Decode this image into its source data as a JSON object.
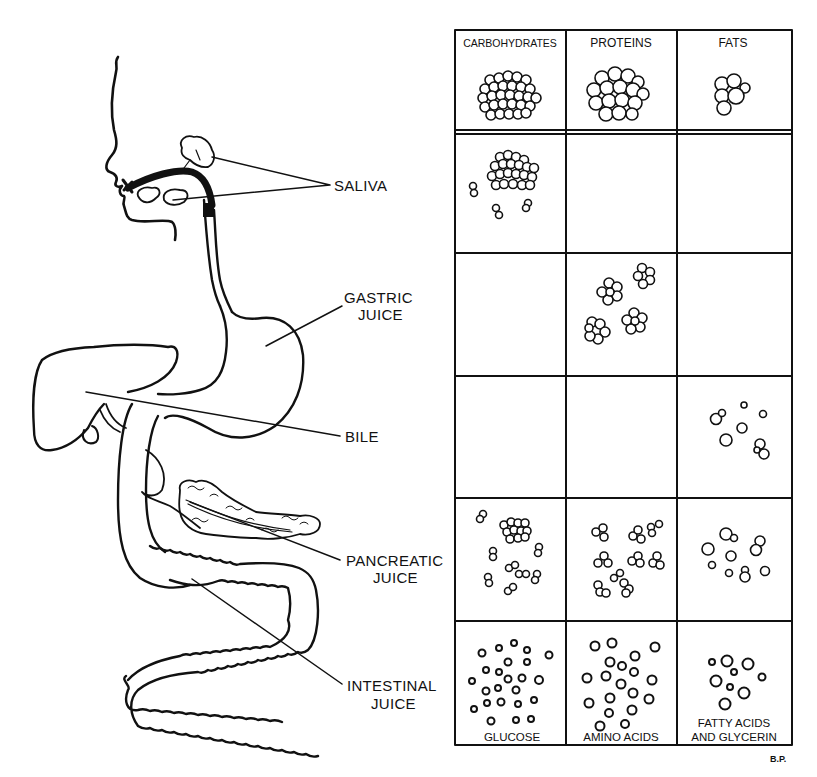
{
  "diagram": {
    "anatomy_labels": [
      {
        "id": "saliva",
        "lines": [
          "SALIVA"
        ]
      },
      {
        "id": "gastric",
        "lines": [
          "GASTRIC",
          "JUICE"
        ]
      },
      {
        "id": "bile",
        "lines": [
          "BILE"
        ]
      },
      {
        "id": "pancreatic",
        "lines": [
          "PANCREATIC",
          "JUICE"
        ]
      },
      {
        "id": "intestinal",
        "lines": [
          "INTESTINAL",
          "JUICE"
        ]
      }
    ],
    "table": {
      "columns": [
        "CARBOHYDRATES",
        "PROTEINS",
        "FATS"
      ],
      "rows": [
        {
          "stage": "food",
          "cells": [
            "large clump",
            "large clump",
            "small clump"
          ]
        },
        {
          "stage": "saliva",
          "cells": [
            "partially broken clump",
            "",
            ""
          ]
        },
        {
          "stage": "gastric juice",
          "cells": [
            "",
            "small clusters",
            ""
          ]
        },
        {
          "stage": "bile",
          "cells": [
            "",
            "",
            "emulsified droplets"
          ]
        },
        {
          "stage": "pancreatic juice",
          "cells": [
            "pairs and clusters",
            "pairs and clusters",
            "droplets"
          ]
        },
        {
          "stage": "intestinal juice",
          "cells": [
            "single molecules",
            "single molecules",
            "single molecules"
          ]
        }
      ],
      "end_products": [
        "GLUCOSE",
        "AMINO ACIDS",
        "FATTY ACIDS",
        "AND GLYCERIN"
      ]
    },
    "signature": "B.P.",
    "colors": {
      "ink": "#111111",
      "paper": "#ffffff"
    }
  }
}
